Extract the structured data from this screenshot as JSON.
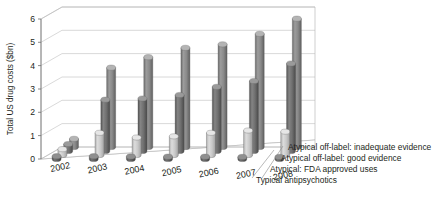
{
  "chart_data": {
    "type": "bar",
    "title": "",
    "subtitle": "",
    "xlabel": "",
    "ylabel": "Total US drug costs ($bn)",
    "ylim": [
      0,
      6
    ],
    "yticks": [
      0,
      1,
      2,
      3,
      4,
      5,
      6
    ],
    "grid": true,
    "legend_position": "bottom-right",
    "style": "3d-cylinder",
    "categories": [
      "2002",
      "2003",
      "2004",
      "2005",
      "2006",
      "2007",
      "2008"
    ],
    "series": [
      {
        "name": "Typical antipsychotics",
        "color": "#5d5d5d",
        "values": [
          0.12,
          0.12,
          0.11,
          0.1,
          0.1,
          0.09,
          0.09
        ]
      },
      {
        "name": "Atypical: FDA approved uses",
        "color": "#c9c9c9",
        "values": [
          0.25,
          0.95,
          0.75,
          0.8,
          0.95,
          1.05,
          1.0
        ]
      },
      {
        "name": "Atypical off-label: good evidence",
        "color": "#6e6e6e",
        "values": [
          0.3,
          2.2,
          2.25,
          2.4,
          2.75,
          3.0,
          3.75
        ]
      },
      {
        "name": "Atypical off-label: inadequate evidence",
        "color": "#888888",
        "values": [
          0.35,
          3.4,
          3.85,
          4.25,
          4.4,
          4.85,
          5.5
        ]
      }
    ]
  },
  "axis": {
    "y_title": "Total US drug costs ($bn)",
    "y_tick_labels": [
      "6",
      "5",
      "4",
      "3",
      "2",
      "1",
      "0"
    ],
    "x_tick_labels": [
      "2002",
      "2003",
      "2004",
      "2005",
      "2006",
      "2007",
      "2008"
    ]
  },
  "legend": {
    "entries": [
      "Atypical off-label: inadequate evidence",
      "Atypical off-label: good evidence",
      "Atypical: FDA approved uses",
      "Typical antipsychotics"
    ]
  }
}
